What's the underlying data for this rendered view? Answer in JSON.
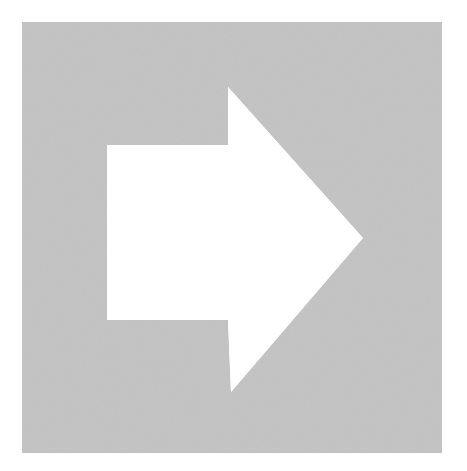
{
  "image": {
    "kind": "vector-glyph-scan",
    "subject": "right-pointing arrow",
    "width": 467,
    "height": 471,
    "page_background_color": "#FFFFFF",
    "description": "A solid light-gray square panel on a white page, with a white right-pointing block arrow knocked out of the square."
  },
  "panel": {
    "name": "gray-square-panel",
    "fill_color": "#C3C3C3",
    "edge_color": "#BDBDBD",
    "x": 22,
    "y": 22,
    "width": 420,
    "height": 431,
    "has_border": false,
    "texture": "fine-grain-noise"
  },
  "arrow": {
    "name": "right-arrow-cutout",
    "fill_color": "#FFFFFF",
    "direction": "right",
    "shaft": {
      "left": 107,
      "top": 145,
      "right": 228,
      "bottom": 320,
      "width": 121,
      "height": 175
    },
    "head": {
      "base_x": 228,
      "top_y": 87,
      "bottom_y": 392,
      "tip_x": 363,
      "tip_y": 238,
      "height": 305,
      "length": 135
    },
    "points": [
      [
        107,
        145
      ],
      [
        228,
        145
      ],
      [
        228,
        87
      ],
      [
        363,
        238
      ],
      [
        231,
        392
      ],
      [
        228,
        320
      ],
      [
        107,
        320
      ]
    ],
    "polygon_points": "107,145 228,145 228,87 363,238 231,392 228,320 107,320"
  },
  "grain": {
    "seed_color_light": "#FFFFFF",
    "seed_color_dark": "#B5B5B5",
    "intensity": 0.55
  }
}
